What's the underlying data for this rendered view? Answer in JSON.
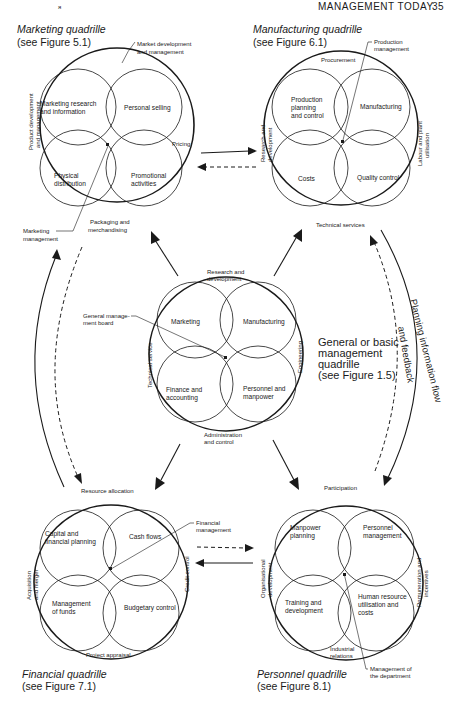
{
  "header": {
    "running_head": "MANAGEMENT TODAY",
    "page_number": "35",
    "mark": "я"
  },
  "quadrilles": {
    "marketing": {
      "title": "Marketing quadrille",
      "ref": "(see Figure 5.1)",
      "segments": [
        "Marketing research",
        "and information",
        "Personal selling",
        "Physical",
        "distribution",
        "Promotional",
        "activities"
      ],
      "ring": {
        "top": [
          "Market development",
          "and management"
        ],
        "left": [
          "Product development",
          "and management"
        ],
        "right": "Pricing",
        "bottom": [
          "Packaging and",
          "merchandising"
        ]
      },
      "center_label": [
        "Marketing",
        "management"
      ]
    },
    "manufacturing": {
      "title": "Manufacturing quadrille",
      "ref": "(see Figure 6.1)",
      "segments": [
        "Production",
        "planning",
        "and control",
        "Manufacturing",
        "Costs",
        "Quality control"
      ],
      "ring": {
        "top": "Procurement",
        "left": [
          "Research and",
          "development"
        ],
        "right": [
          "Labour and plant",
          "utilisation"
        ],
        "bottom": "Technical services"
      },
      "center_label": [
        "Production",
        "management"
      ]
    },
    "general": {
      "title": [
        "General or basic",
        "management",
        "quadrille",
        "(see Figure 1.5)"
      ],
      "segments": [
        "Marketing",
        "Manufacturing",
        "Finance and",
        "accounting",
        "Personnel and",
        "manpower"
      ],
      "ring": {
        "top": [
          "Research and",
          "development"
        ],
        "left": "Technical service",
        "right": "Engineering",
        "bottom": [
          "Administration",
          "and control"
        ]
      },
      "center_label": [
        "General manage-",
        "ment board"
      ]
    },
    "financial": {
      "title": "Financial quadrille",
      "ref": "(see Figure 7.1)",
      "segments": [
        "Capital and",
        "financial planning",
        "Cash flows",
        "Management",
        "of funds",
        "Budgetary control"
      ],
      "ring": {
        "top": "Resource allocation",
        "left": [
          "Acquisition",
          "and merger"
        ],
        "right": "Credit control",
        "bottom": "Project appraisal"
      },
      "center_label": [
        "Financial",
        "management"
      ]
    },
    "personnel": {
      "title": "Personnel quadrille",
      "ref": "(see Figure 8.1)",
      "segments": [
        "Manpower",
        "planning",
        "Personnel",
        "management",
        "Training and",
        "development",
        "Human resource",
        "utilisation and",
        "costs"
      ],
      "ring": {
        "top": "Participation",
        "left": [
          "Organisational",
          "development"
        ],
        "right": [
          "Remuneration and",
          "incentives"
        ],
        "bottom": [
          "Industrial",
          "relations"
        ]
      },
      "center_label": [
        "Management of",
        "the department"
      ]
    }
  },
  "flow": {
    "line1": "Planning information flow",
    "line2": "and feedback"
  },
  "colors": {
    "ink": "#1a1a1a",
    "paper": "#ffffff"
  }
}
